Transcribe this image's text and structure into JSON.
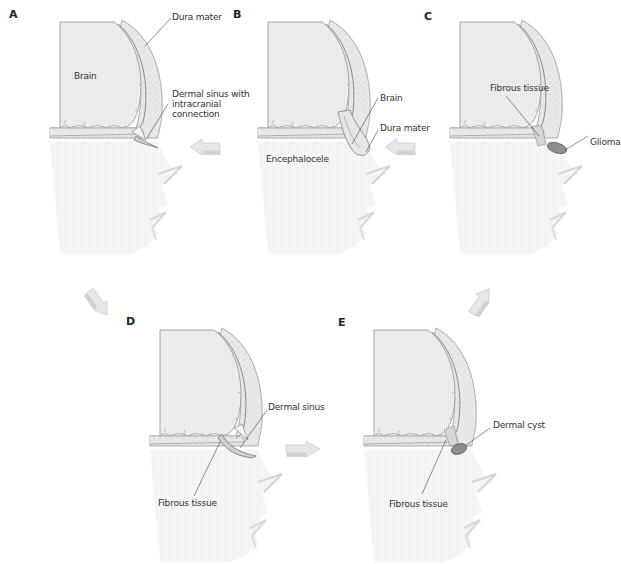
{
  "figure": {
    "colors": {
      "brain_fill": "#eeeeee",
      "brain_stroke": "#9a9a9a",
      "bone_fill": "#e3e3e3",
      "dura_stroke": "#8a8a8a",
      "face_fill": "#f6f6f6",
      "arrow_fill": "#e2e2e2",
      "arrow_side": "#c8c8c8",
      "lesion_fill": "#8e8e8e",
      "leader_line": "#444444",
      "text": "#333333"
    },
    "panels": [
      {
        "id": "A",
        "letter": "A",
        "labels": [
          {
            "text": "Dura mater"
          },
          {
            "text": "Brain"
          },
          {
            "text": "Dermal sinus with\nintracranial\nconnection"
          }
        ]
      },
      {
        "id": "B",
        "letter": "B",
        "labels": [
          {
            "text": "Brain"
          },
          {
            "text": "Dura mater"
          },
          {
            "text": "Encephalocele"
          }
        ]
      },
      {
        "id": "C",
        "letter": "C",
        "labels": [
          {
            "text": "Fibrous tissue"
          },
          {
            "text": "Glioma"
          }
        ]
      },
      {
        "id": "D",
        "letter": "D",
        "labels": [
          {
            "text": "Dermal sinus"
          },
          {
            "text": "Fibrous tissue"
          }
        ]
      },
      {
        "id": "E",
        "letter": "E",
        "labels": [
          {
            "text": "Dermal cyst"
          },
          {
            "text": "Fibrous tissue"
          }
        ]
      }
    ],
    "arrows": [
      {
        "from": "A",
        "to": "B",
        "direction": "left"
      },
      {
        "from": "B",
        "to": "C",
        "direction": "left"
      },
      {
        "from": "A",
        "to": "D",
        "direction": "down-right"
      },
      {
        "from": "D",
        "to": "E",
        "direction": "right"
      },
      {
        "from": "E",
        "to": "C",
        "direction": "up-right"
      }
    ]
  }
}
